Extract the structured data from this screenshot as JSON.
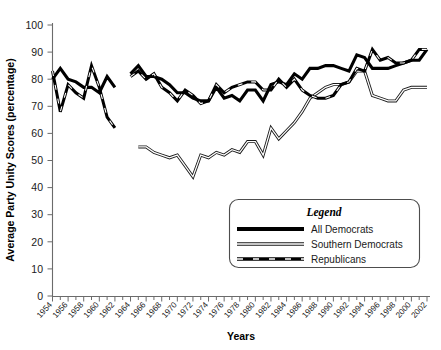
{
  "chart_data": {
    "type": "line",
    "title": "",
    "xlabel": "Years",
    "ylabel": "Average Party Unity Scores (percentage)",
    "ylim": [
      0,
      100
    ],
    "yticks": [
      0,
      10,
      20,
      30,
      40,
      50,
      60,
      70,
      80,
      90,
      100
    ],
    "xlim": [
      1954,
      2002
    ],
    "xticks": [
      1954,
      1956,
      1958,
      1960,
      1962,
      1964,
      1966,
      1968,
      1970,
      1972,
      1974,
      1976,
      1978,
      1980,
      1982,
      1984,
      1986,
      1988,
      1990,
      1992,
      1994,
      1996,
      1998,
      2000,
      2002
    ],
    "xtick_labels": [
      "1954",
      "1956",
      "1958",
      "1960",
      "1962",
      "1964",
      "1966",
      "1968",
      "1970",
      "1972",
      "1974",
      "1976",
      "1978",
      "1980",
      "1982",
      "1984",
      "1986",
      "1988",
      "1990",
      "1992",
      "1994",
      "1996",
      "1998",
      "2000",
      "2002"
    ],
    "grid": false,
    "legend_position": "bottom-right",
    "series": [
      {
        "name": "All Democrats",
        "color": "#000000",
        "style": "solid-thick",
        "x": [
          1954,
          1955,
          1956,
          1957,
          1958,
          1959,
          1960,
          1961,
          1962,
          1964,
          1965,
          1966,
          1967,
          1968,
          1969,
          1970,
          1971,
          1972,
          1973,
          1974,
          1975,
          1976,
          1977,
          1978,
          1979,
          1980,
          1981,
          1982,
          1983,
          1984,
          1985,
          1986,
          1987,
          1988,
          1989,
          1990,
          1991,
          1992,
          1993,
          1994,
          1995,
          1996,
          1997,
          1998,
          1999,
          2000,
          2001,
          2002
        ],
        "values": [
          80,
          84,
          80,
          79,
          77,
          77,
          75,
          81,
          77,
          82,
          85,
          81,
          81,
          80,
          78,
          75,
          75,
          73,
          72,
          72,
          77,
          73,
          74,
          72,
          76,
          76,
          72,
          78,
          79,
          78,
          82,
          80,
          84,
          84,
          85,
          85,
          84,
          83,
          89,
          88,
          84,
          84,
          84,
          85,
          86,
          87,
          87,
          91
        ],
        "note": "Gap in data between 1962 and 1964"
      },
      {
        "name": "Southern Democrats",
        "color": "#808080",
        "style": "outlined",
        "x": [
          1965,
          1966,
          1967,
          1968,
          1969,
          1970,
          1971,
          1972,
          1973,
          1974,
          1975,
          1976,
          1977,
          1978,
          1979,
          1980,
          1981,
          1982,
          1983,
          1984,
          1985,
          1986,
          1987,
          1988,
          1989,
          1990,
          1991,
          1992,
          1993,
          1994,
          1995,
          1996,
          1997,
          1998,
          1999,
          2000,
          2001,
          2002
        ],
        "values": [
          55,
          55,
          53,
          52,
          51,
          52,
          48,
          44,
          52,
          51,
          53,
          52,
          54,
          53,
          57,
          57,
          52,
          62,
          58,
          61,
          64,
          68,
          73,
          75,
          77,
          78,
          78,
          79,
          83,
          83,
          74,
          73,
          72,
          72,
          76,
          77,
          77,
          77
        ]
      },
      {
        "name": "Republicans",
        "color": "#000000",
        "style": "dashed-thick",
        "x": [
          1954,
          1955,
          1956,
          1957,
          1958,
          1959,
          1960,
          1961,
          1962,
          1964,
          1965,
          1966,
          1967,
          1968,
          1969,
          1970,
          1971,
          1972,
          1973,
          1974,
          1975,
          1976,
          1977,
          1978,
          1979,
          1980,
          1981,
          1982,
          1983,
          1984,
          1985,
          1986,
          1987,
          1988,
          1989,
          1990,
          1991,
          1992,
          1993,
          1994,
          1995,
          1996,
          1997,
          1998,
          1999,
          2000,
          2001,
          2002
        ],
        "values": [
          83,
          68,
          78,
          75,
          73,
          85,
          77,
          66,
          62,
          81,
          83,
          80,
          82,
          77,
          75,
          72,
          76,
          74,
          71,
          72,
          78,
          75,
          77,
          78,
          79,
          79,
          76,
          76,
          80,
          77,
          80,
          76,
          74,
          73,
          73,
          74,
          78,
          79,
          84,
          83,
          91,
          87,
          88,
          86,
          86,
          87,
          91,
          91
        ],
        "note": "Gap in data between 1962 and 1964"
      }
    ]
  },
  "legend": {
    "title": "Legend",
    "entries": [
      {
        "label": "All Democrats",
        "swatch": "solid-black-thick"
      },
      {
        "label": "Southern Democrats",
        "swatch": "gray-outlined"
      },
      {
        "label": "Republicans",
        "swatch": "black-dashed"
      }
    ]
  },
  "axes": {
    "y_title": "Average Party Unity Scores (percentage)",
    "x_title": "Years",
    "y_labels": [
      "100",
      "90",
      "80",
      "70",
      "60",
      "50",
      "40",
      "30",
      "20",
      "10",
      "0"
    ],
    "x_labels": [
      "1954",
      "1956",
      "1958",
      "1960",
      "1962",
      "1964",
      "1966",
      "1968",
      "1970",
      "1972",
      "1974",
      "1976",
      "1978",
      "1980",
      "1982",
      "1984",
      "1986",
      "1988",
      "1990",
      "1992",
      "1994",
      "1996",
      "1998",
      "2000",
      "2002"
    ]
  }
}
